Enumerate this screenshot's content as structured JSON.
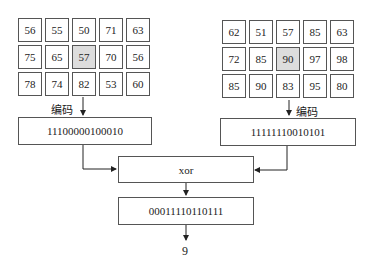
{
  "left_grid": {
    "rows": [
      [
        "56",
        "55",
        "50",
        "71",
        "63"
      ],
      [
        "75",
        "65",
        "57",
        "70",
        "56"
      ],
      [
        "78",
        "74",
        "82",
        "53",
        "60"
      ]
    ],
    "highlight": [
      1,
      2
    ]
  },
  "right_grid": {
    "rows": [
      [
        "62",
        "51",
        "57",
        "85",
        "63"
      ],
      [
        "72",
        "85",
        "90",
        "97",
        "98"
      ],
      [
        "85",
        "90",
        "83",
        "95",
        "80"
      ]
    ],
    "highlight": [
      1,
      2
    ]
  },
  "left_encode_label": "编码",
  "right_encode_label": "编码",
  "left_code": "11100000100010",
  "right_code": "11111110010101",
  "xor_label": "xor",
  "xor_result": "00011110110111",
  "final_result": "9"
}
